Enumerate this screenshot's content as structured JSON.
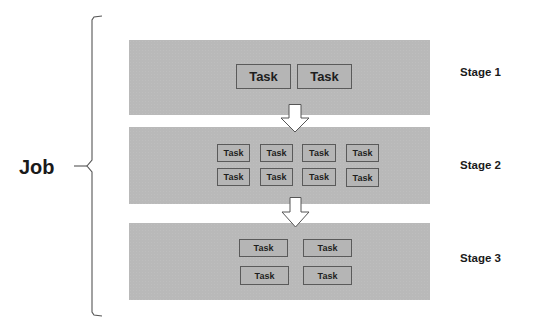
{
  "job": {
    "label": "Job"
  },
  "stages": [
    {
      "label": "Stage 1",
      "tasks": [
        "Task",
        "Task"
      ]
    },
    {
      "label": "Stage 2",
      "tasks": [
        "Task",
        "Task",
        "Task",
        "Task",
        "Task",
        "Task",
        "Task",
        "Task"
      ]
    },
    {
      "label": "Stage 3",
      "tasks": [
        "Task",
        "Task",
        "Task",
        "Task"
      ]
    }
  ],
  "colors": {
    "panel": "#b9b9b9",
    "task_border": "#5a5a5a",
    "text": "#1a1a1a",
    "arrow_stroke": "#555555",
    "arrow_fill": "#ffffff"
  }
}
